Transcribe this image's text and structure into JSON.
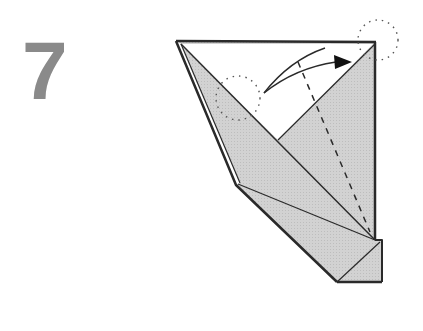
{
  "step": {
    "number": "7"
  },
  "diagram": {
    "colors": {
      "paper_shaded": "#d4d4d4",
      "paper_white": "#ffffff",
      "outline": "#2a2a2a",
      "step_number": "#8a8a8a"
    },
    "icons": [
      "fold-arrow-icon",
      "dotted-circle-marker-icon",
      "valley-fold-line-icon"
    ]
  }
}
